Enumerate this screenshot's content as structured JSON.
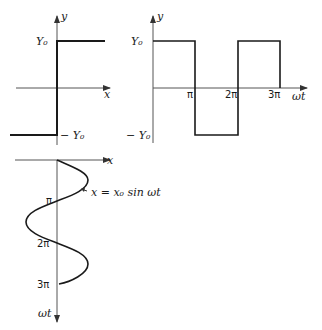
{
  "panels": {
    "step": {
      "y_axis_label": "y",
      "x_axis_label": "x",
      "upper_level_label": "Y₀",
      "lower_level_label": "− Y₀"
    },
    "square_wave": {
      "y_axis_label": "y",
      "x_axis_label": "ωt",
      "upper_level_label": "Y₀",
      "lower_level_label": "− Y₀",
      "ticks": [
        "π",
        "2π",
        "3π"
      ]
    },
    "sine": {
      "x_axis_label": "x",
      "t_axis_label": "ωt",
      "ticks": [
        "π",
        "2π",
        "3π"
      ],
      "equation": "x = x₀ sin ωt"
    }
  },
  "colors": {
    "line": "#1a1a1a",
    "axis": "#555555",
    "background": "#ffffff"
  }
}
